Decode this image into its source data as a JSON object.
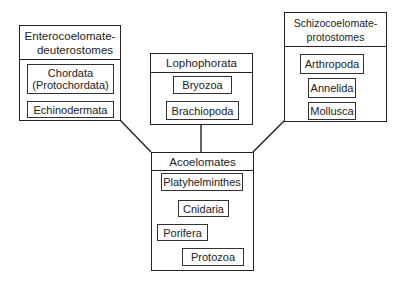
{
  "diagram": {
    "groups": [
      {
        "id": "enterocoelomate",
        "title_lines": [
          "Enterocoelomate-",
          "deuterostomes"
        ],
        "members": [
          {
            "lines": [
              "Chordata",
              "(Protochordata)"
            ]
          },
          {
            "lines": [
              "Echinodermata"
            ]
          }
        ]
      },
      {
        "id": "lophophorata",
        "title_lines": [
          "Lophophorata"
        ],
        "members": [
          {
            "lines": [
              "Bryozoa"
            ]
          },
          {
            "lines": [
              "Brachiopoda"
            ]
          }
        ]
      },
      {
        "id": "schizocoelomate",
        "title_lines": [
          "Schizocoelomate-",
          "protostomes"
        ],
        "members": [
          {
            "lines": [
              "Arthropoda"
            ]
          },
          {
            "lines": [
              "Annelida"
            ]
          },
          {
            "lines": [
              "Mollusca"
            ]
          }
        ]
      },
      {
        "id": "acoelomates",
        "title_lines": [
          "Acoelomates"
        ],
        "members": [
          {
            "lines": [
              "Platyhelminthes"
            ]
          },
          {
            "lines": [
              "Cnidaria"
            ]
          },
          {
            "lines": [
              "Porifera"
            ]
          },
          {
            "lines": [
              "Protozoa"
            ]
          }
        ]
      }
    ],
    "edges": [
      {
        "from": "acoelomates",
        "to": "enterocoelomate"
      },
      {
        "from": "acoelomates",
        "to": "lophophorata"
      },
      {
        "from": "acoelomates",
        "to": "schizocoelomate"
      }
    ],
    "colors": {
      "line": "#222222",
      "background": "#ffffff"
    }
  }
}
